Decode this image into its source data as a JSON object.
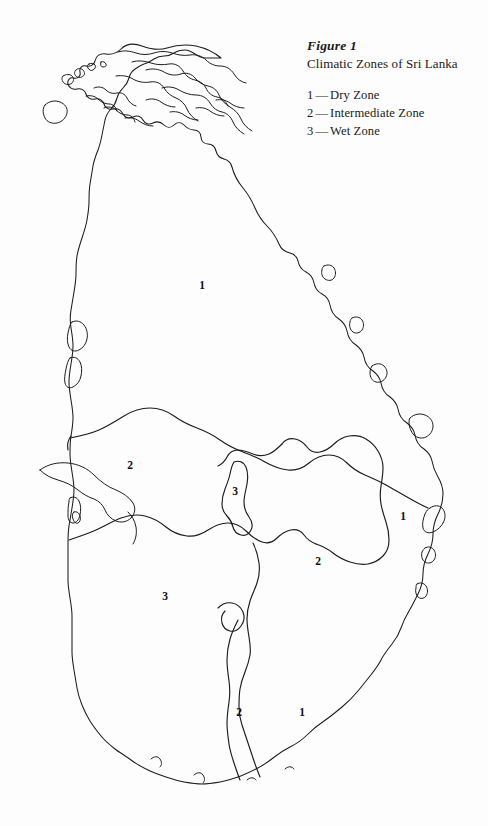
{
  "figure": {
    "label": "Figure 1",
    "title": "Climatic Zones of Sri Lanka"
  },
  "legend": {
    "items": [
      {
        "key": "1",
        "dash": "—",
        "name": "Dry Zone"
      },
      {
        "key": "2",
        "dash": "—",
        "name": "Intermediate Zone"
      },
      {
        "key": "3",
        "dash": "—",
        "name": "Wet Zone"
      }
    ]
  },
  "map": {
    "region": "Sri Lanka",
    "background_color": "#fdfdfd",
    "outline_color": "#1c1c1c",
    "zone_labels": [
      {
        "value": "1",
        "zone": "Dry Zone",
        "x": 202,
        "y": 285
      },
      {
        "value": "2",
        "zone": "Intermediate Zone",
        "x": 130,
        "y": 465
      },
      {
        "value": "3",
        "zone": "Wet Zone",
        "x": 235,
        "y": 491
      },
      {
        "value": "1",
        "zone": "Dry Zone",
        "x": 403,
        "y": 516
      },
      {
        "value": "2",
        "zone": "Intermediate Zone",
        "x": 318,
        "y": 561
      },
      {
        "value": "3",
        "zone": "Wet Zone",
        "x": 165,
        "y": 596
      },
      {
        "value": "2",
        "zone": "Intermediate Zone",
        "x": 239,
        "y": 712
      },
      {
        "value": "1",
        "zone": "Dry Zone",
        "x": 302,
        "y": 712
      }
    ]
  }
}
